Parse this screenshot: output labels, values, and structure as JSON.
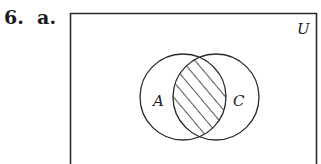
{
  "problem": {
    "number": "6.",
    "part": "a."
  },
  "diagram": {
    "type": "venn",
    "universe_label": "U",
    "sets": [
      {
        "name": "A",
        "cx": 183,
        "cy": 97,
        "r": 43
      },
      {
        "name": "C",
        "cx": 216,
        "cy": 97,
        "r": 43
      }
    ],
    "shaded_region": "A ∩ C",
    "shading_style": "diagonal-hatch",
    "colors": {
      "stroke": "#2a2a2a",
      "background": "#ffffff"
    }
  }
}
